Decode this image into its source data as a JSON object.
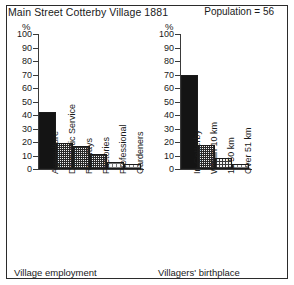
{
  "header": {
    "title": "Main Street  Cotterby Village 1881",
    "population": "Population = 56"
  },
  "axis_unit_left": "%",
  "axis_unit_right": "%",
  "captions": {
    "left": "Village employment",
    "right": "Villagers' birthplace"
  },
  "chart_data": [
    {
      "type": "bar",
      "title": "Village employment",
      "xlabel": "",
      "ylabel": "%",
      "ylim": [
        0,
        100
      ],
      "yticks": [
        "0",
        "10",
        "20",
        "30",
        "40",
        "50",
        "60",
        "70",
        "80",
        "90",
        "100"
      ],
      "grid": false,
      "legend": "none",
      "categories": [
        "Agriculture",
        "Domestic Service",
        "Railways",
        "Factories",
        "Professional",
        "Gardeners"
      ],
      "values": [
        42,
        19,
        17,
        11,
        5,
        4
      ],
      "fills": [
        "solid",
        "dense",
        "dense",
        "dense",
        "light",
        "light"
      ]
    },
    {
      "type": "bar",
      "title": "Villagers' birthplace",
      "xlabel": "",
      "ylabel": "%",
      "ylim": [
        0,
        100
      ],
      "yticks": [
        "0",
        "10",
        "20",
        "30",
        "40",
        "50",
        "60",
        "70",
        "80",
        "90",
        "100"
      ],
      "grid": false,
      "legend": "none",
      "categories": [
        "In Cotterby",
        "Within 10 km",
        "11-50 km",
        "Over 51 km"
      ],
      "values": [
        70,
        18,
        8,
        4
      ],
      "fills": [
        "solid",
        "dense",
        "medium",
        "light"
      ]
    }
  ]
}
